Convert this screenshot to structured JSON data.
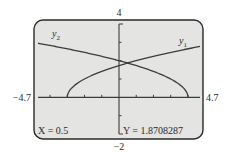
{
  "chart_data": {
    "type": "line",
    "title": "",
    "window": {
      "xmin": -4.7,
      "xmax": 4.7,
      "ymin": -2,
      "ymax": 4,
      "xscl": 1,
      "yscl": 1
    },
    "axis_labels": {
      "xmin": "−4.7",
      "xmax": "4.7",
      "ymin": "−2",
      "ymax": "4"
    },
    "series": [
      {
        "name": "y1",
        "label": "y",
        "subscript": "1",
        "expression": "sqrt(x+3)",
        "domain": [
          -3,
          4.7
        ]
      },
      {
        "name": "y2",
        "label": "y",
        "subscript": "2",
        "expression": "sqrt(4-x)",
        "domain": [
          -4.7,
          4
        ]
      }
    ],
    "intersection": {
      "x": 0.5,
      "y": 1.8708287
    },
    "grid": false,
    "legend": "inline labels"
  },
  "readout": {
    "x_text": "X = 0.5",
    "y_text": "Y = 1.8708287"
  },
  "colors": {
    "screen_bg": "#e4e4e2",
    "line": "#3c3c3c",
    "frame": "#2a2a2a"
  }
}
